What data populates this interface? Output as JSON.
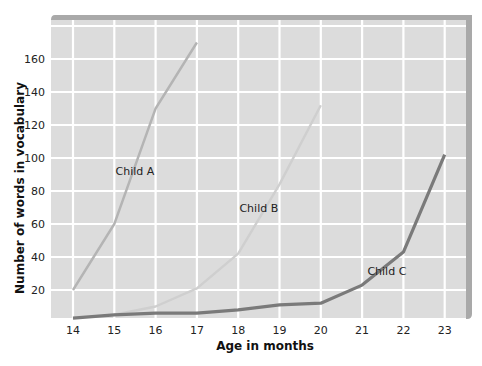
{
  "chart_data": {
    "type": "line",
    "title": "",
    "xlabel": "Age in months",
    "ylabel": "Number of words in vocabulary",
    "x": [
      14,
      15,
      16,
      17,
      18,
      19,
      20,
      21,
      22,
      23
    ],
    "x_ticks": [
      "14",
      "15",
      "16",
      "17",
      "18",
      "19",
      "20",
      "21",
      "22",
      "23"
    ],
    "y_ticks": [
      "20",
      "40",
      "60",
      "80",
      "100",
      "120",
      "140",
      "160"
    ],
    "ylim": [
      0,
      175
    ],
    "xlim": [
      14,
      23
    ],
    "grid": true,
    "legend": "inline labels",
    "series": [
      {
        "name": "Child A",
        "color": "#b4b4b4",
        "x": [
          14,
          15,
          16,
          17
        ],
        "values": [
          20,
          60,
          130,
          170
        ],
        "label_pos": {
          "x": 15.5,
          "y": 90
        }
      },
      {
        "name": "Child B",
        "color": "#cfcfcf",
        "x": [
          15,
          16,
          17,
          18,
          19,
          20
        ],
        "values": [
          5,
          10,
          21,
          42,
          84,
          132
        ],
        "label_pos": {
          "x": 18.5,
          "y": 67
        }
      },
      {
        "name": "Child C",
        "color": "#7a7a7a",
        "x": [
          14,
          15,
          16,
          17,
          18,
          19,
          20,
          21,
          22,
          23
        ],
        "values": [
          3,
          5,
          6,
          6,
          8,
          11,
          12,
          23,
          43,
          102
        ],
        "label_pos": {
          "x": 21.6,
          "y": 29
        }
      }
    ]
  },
  "colors": {
    "plot_background": "#dcdcdc",
    "gridline": "#ffffff",
    "frame_shadow": "#a9a9a9"
  }
}
